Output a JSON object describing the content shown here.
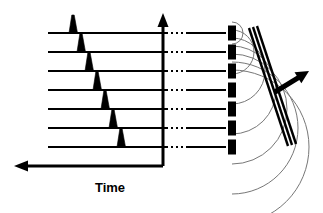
{
  "figure": {
    "title": "",
    "type": "phased-array-beam-steering-diagram",
    "width": 323,
    "height": 213,
    "background_color": "#ffffff",
    "line_color": "#000000",
    "wavelet_color": "#777777"
  },
  "axes": {
    "time_axis": {
      "label": "Time",
      "label_x": 110,
      "label_y": 192,
      "direction": "left",
      "line_y": 166,
      "line_x_start": 163,
      "line_x_end": 26,
      "arrow_tip_x": 14,
      "arrow_tip_y": 166,
      "stroke_width": 3
    },
    "vertical_axis": {
      "label": "",
      "direction": "up",
      "line_x": 163,
      "line_y_start": 166,
      "line_y_end": 24,
      "arrow_tip_x": 163,
      "arrow_tip_y": 13,
      "stroke_width": 3
    }
  },
  "channels": {
    "count": 7,
    "line_x_start": 48,
    "dotted_x_start": 166,
    "dotted_x_end": 186,
    "line_x_end": 226,
    "stroke_width": 2.2,
    "rows": [
      {
        "index": 1,
        "y": 33,
        "pulse_x": 73,
        "pulse_height": 18,
        "delay_label": ""
      },
      {
        "index": 2,
        "y": 52,
        "pulse_x": 81,
        "pulse_height": 18,
        "delay_label": ""
      },
      {
        "index": 3,
        "y": 71,
        "pulse_x": 89,
        "pulse_height": 18,
        "delay_label": ""
      },
      {
        "index": 4,
        "y": 90,
        "pulse_x": 97,
        "pulse_height": 18,
        "delay_label": ""
      },
      {
        "index": 5,
        "y": 109,
        "pulse_x": 105,
        "pulse_height": 18,
        "delay_label": ""
      },
      {
        "index": 6,
        "y": 128,
        "pulse_x": 113,
        "pulse_height": 18,
        "delay_label": ""
      },
      {
        "index": 7,
        "y": 147,
        "pulse_x": 121,
        "pulse_height": 18,
        "delay_label": ""
      }
    ]
  },
  "transducer_array": {
    "element_count": 7,
    "element_x": 228,
    "element_width": 8,
    "element_height": 15,
    "element_color": "#000000",
    "elements": [
      {
        "index": 1,
        "y": 33,
        "wavelet_radius": 11
      },
      {
        "index": 2,
        "y": 52,
        "wavelet_radius": 22
      },
      {
        "index": 3,
        "y": 71,
        "wavelet_radius": 33
      },
      {
        "index": 4,
        "y": 90,
        "wavelet_radius": 44
      },
      {
        "index": 5,
        "y": 109,
        "wavelet_radius": 55
      },
      {
        "index": 6,
        "y": 128,
        "wavelet_radius": 66
      },
      {
        "index": 7,
        "y": 147,
        "wavelet_radius": 77
      }
    ]
  },
  "wavefront": {
    "description": "tilted composite wavefront",
    "line_count": 3,
    "color": "#000000",
    "stroke_width": 2.4,
    "tilt_degrees": 20,
    "lines": [
      {
        "x1": 249,
        "y1": 28,
        "x2": 288,
        "y2": 146
      },
      {
        "x1": 253,
        "y1": 27,
        "x2": 292,
        "y2": 145
      },
      {
        "x1": 257,
        "y1": 26,
        "x2": 296,
        "y2": 144
      }
    ]
  },
  "beam_direction_arrow": {
    "label": "",
    "x1": 275,
    "y1": 92,
    "x2": 309,
    "y2": 71,
    "stroke_width": 5,
    "color": "#000000"
  }
}
